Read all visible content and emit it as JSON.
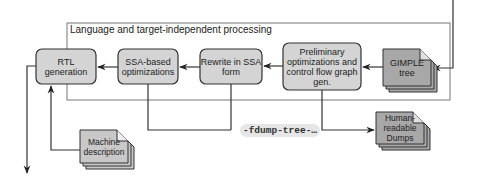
{
  "diagram": {
    "region_title": "Language and target-independent processing",
    "nodes": {
      "rtl_generation": "RTL generation",
      "ssa_optimizations_line1": "SSA-based",
      "ssa_optimizations_line2": "optimizations",
      "rewrite_ssa_line1": "Rewrite in SSA",
      "rewrite_ssa_line2": "form",
      "preliminary_line1": "Preliminary",
      "preliminary_line2": "optimizations and",
      "preliminary_line3": "control flow graph",
      "preliminary_line4": "gen.",
      "gimple_line1": "GIMPLE",
      "gimple_line2": "tree",
      "machine_desc_line1": "Machine",
      "machine_desc_line2": "description",
      "dumps_line1": "Human-",
      "dumps_line2": "readable",
      "dumps_line3": "Dumps"
    },
    "edge_labels": {
      "dump_flag": "-fdump-tree-…"
    },
    "colors": {
      "process_box_fill": "#d4d4d4",
      "document_fill": "#a8a8a8",
      "line": "#333333",
      "region_border": "#777777"
    }
  }
}
